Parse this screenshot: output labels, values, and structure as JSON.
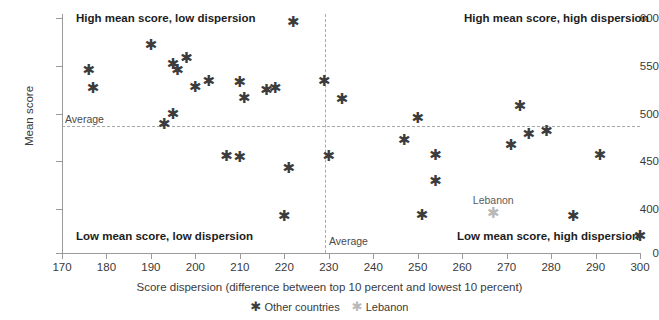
{
  "chart_data": {
    "type": "scatter",
    "title": "",
    "xlabel": "Score dispersion (difference between top 10 percent and lowest 10 percent)",
    "ylabel": "Mean score",
    "xlim": [
      170,
      300
    ],
    "ylim": [
      0,
      600
    ],
    "xticks": [
      170,
      180,
      190,
      200,
      210,
      220,
      230,
      240,
      250,
      260,
      270,
      280,
      290,
      300
    ],
    "yticks": [
      0,
      400,
      450,
      500,
      550,
      600
    ],
    "y_axis_broken": true,
    "grid": false,
    "legend_position": "bottom",
    "reference_lines": {
      "horizontal": {
        "label": "Average",
        "value": 487
      },
      "vertical": {
        "label": "Average",
        "value": 231
      }
    },
    "annotations": [
      {
        "text": "High mean score, low dispersion",
        "x": 188,
        "y": 597
      },
      {
        "text": "High mean score, high dispersion",
        "x": 278,
        "y": 597
      },
      {
        "text": "Low mean score, low dispersion",
        "x": 188,
        "y": 428
      },
      {
        "text": "Low mean score, high dispersion",
        "x": 281,
        "y": 428
      }
    ],
    "series": [
      {
        "name": "Other countries",
        "marker": "asterisk",
        "color": "#3c3c3c",
        "points": [
          {
            "x": 176,
            "y": 546
          },
          {
            "x": 177,
            "y": 527
          },
          {
            "x": 190,
            "y": 572
          },
          {
            "x": 195,
            "y": 552
          },
          {
            "x": 196,
            "y": 546
          },
          {
            "x": 198,
            "y": 558
          },
          {
            "x": 195,
            "y": 500
          },
          {
            "x": 193,
            "y": 489
          },
          {
            "x": 200,
            "y": 528
          },
          {
            "x": 203,
            "y": 534
          },
          {
            "x": 207,
            "y": 455
          },
          {
            "x": 210,
            "y": 454
          },
          {
            "x": 210,
            "y": 533
          },
          {
            "x": 211,
            "y": 516
          },
          {
            "x": 216,
            "y": 525
          },
          {
            "x": 218,
            "y": 527
          },
          {
            "x": 220,
            "y": 393
          },
          {
            "x": 221,
            "y": 443
          },
          {
            "x": 222,
            "y": 596
          },
          {
            "x": 229,
            "y": 534
          },
          {
            "x": 230,
            "y": 455
          },
          {
            "x": 233,
            "y": 515
          },
          {
            "x": 247,
            "y": 472
          },
          {
            "x": 250,
            "y": 495
          },
          {
            "x": 251,
            "y": 394
          },
          {
            "x": 254,
            "y": 457
          },
          {
            "x": 254,
            "y": 429
          },
          {
            "x": 271,
            "y": 467
          },
          {
            "x": 273,
            "y": 508
          },
          {
            "x": 275,
            "y": 479
          },
          {
            "x": 279,
            "y": 482
          },
          {
            "x": 285,
            "y": 393
          },
          {
            "x": 291,
            "y": 457
          }
        ]
      },
      {
        "name": "Lebanon",
        "marker": "asterisk",
        "color": "#b9b9b9",
        "points": [
          {
            "x": 267,
            "y": 396,
            "label": "Lebanon"
          }
        ]
      }
    ]
  },
  "axis": {
    "y_title": "Mean score",
    "x_title": "Score dispersion (difference between top 10 percent and lowest 10 percent)",
    "x_tick_labels": [
      "170",
      "180",
      "190",
      "200",
      "210",
      "220",
      "230",
      "240",
      "250",
      "260",
      "270",
      "280",
      "290",
      "300"
    ],
    "y_tick_labels": [
      "600",
      "550",
      "500",
      "450",
      "400",
      "0"
    ]
  },
  "reference": {
    "horizontal_label": "Average",
    "vertical_label": "Average"
  },
  "quadrants": {
    "top_left": "High mean score, low dispersion",
    "top_right": "High mean score, high dispersion",
    "bottom_left": "Low mean score, low dispersion",
    "bottom_right": "Low mean score, high dispersion"
  },
  "legend": {
    "items": [
      {
        "label": "Other countries",
        "marker": "asterisk-icon",
        "color": "#3c3c3c"
      },
      {
        "label": "Lebanon",
        "marker": "asterisk-icon",
        "color": "#b9b9b9"
      }
    ]
  },
  "marker_glyph": "✱"
}
